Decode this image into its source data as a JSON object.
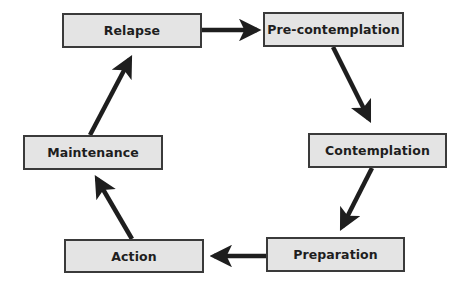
{
  "diagram": {
    "type": "cycle",
    "title": "",
    "colors": {
      "box_fill": "#e4e4e4",
      "box_border": "#3a3a3a",
      "arrow": "#1e1e1e",
      "text": "#1e1e1e",
      "background": "#ffffff"
    },
    "stages": [
      {
        "id": "relapse",
        "label": "Relapse"
      },
      {
        "id": "precontemplation",
        "label": "Pre-contemplation"
      },
      {
        "id": "contemplation",
        "label": "Contemplation"
      },
      {
        "id": "preparation",
        "label": "Preparation"
      },
      {
        "id": "action",
        "label": "Action"
      },
      {
        "id": "maintenance",
        "label": "Maintenance"
      }
    ],
    "edges": [
      {
        "from": "relapse",
        "to": "precontemplation"
      },
      {
        "from": "precontemplation",
        "to": "contemplation"
      },
      {
        "from": "contemplation",
        "to": "preparation"
      },
      {
        "from": "preparation",
        "to": "action"
      },
      {
        "from": "action",
        "to": "maintenance"
      },
      {
        "from": "maintenance",
        "to": "relapse"
      }
    ]
  }
}
